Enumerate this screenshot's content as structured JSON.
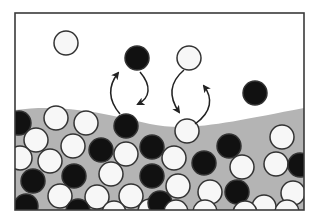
{
  "diagram": {
    "type": "surface-adsorption-desorption",
    "frame": {
      "x": 15,
      "y": 13,
      "width": 289,
      "height": 197,
      "stroke": "#3a3a3a"
    },
    "colors": {
      "background": "#ffffff",
      "substrate": "#b4b4b4",
      "black_particle": "#111111",
      "white_particle": "#f7f7f7",
      "outline": "#333333"
    },
    "gas_particles": [
      {
        "x": 66,
        "y": 43,
        "r": 12,
        "fill": "white"
      },
      {
        "x": 137,
        "y": 58,
        "r": 12,
        "fill": "black"
      },
      {
        "x": 189,
        "y": 58,
        "r": 12,
        "fill": "white"
      },
      {
        "x": 255,
        "y": 93,
        "r": 12,
        "fill": "black"
      }
    ],
    "surface_particles": [
      {
        "x": 126,
        "y": 126,
        "r": 12,
        "fill": "black"
      },
      {
        "x": 187,
        "y": 131,
        "r": 12,
        "fill": "white"
      }
    ],
    "bulk_particles": [
      {
        "x": 19,
        "y": 123,
        "fill": "black"
      },
      {
        "x": 56,
        "y": 118,
        "fill": "white"
      },
      {
        "x": 86,
        "y": 123,
        "fill": "white"
      },
      {
        "x": 36,
        "y": 140,
        "fill": "white"
      },
      {
        "x": 73,
        "y": 146,
        "fill": "white"
      },
      {
        "x": 101,
        "y": 150,
        "fill": "black"
      },
      {
        "x": 126,
        "y": 154,
        "fill": "white"
      },
      {
        "x": 152,
        "y": 147,
        "fill": "black"
      },
      {
        "x": 20,
        "y": 158,
        "fill": "white"
      },
      {
        "x": 50,
        "y": 161,
        "fill": "white"
      },
      {
        "x": 74,
        "y": 176,
        "fill": "black"
      },
      {
        "x": 111,
        "y": 174,
        "fill": "white"
      },
      {
        "x": 152,
        "y": 176,
        "fill": "black"
      },
      {
        "x": 33,
        "y": 181,
        "fill": "black"
      },
      {
        "x": 60,
        "y": 196,
        "fill": "white"
      },
      {
        "x": 97,
        "y": 197,
        "fill": "white"
      },
      {
        "x": 131,
        "y": 196,
        "fill": "white"
      },
      {
        "x": 26,
        "y": 206,
        "fill": "black"
      },
      {
        "x": 78,
        "y": 211,
        "fill": "black"
      },
      {
        "x": 114,
        "y": 213,
        "fill": "white"
      },
      {
        "x": 150,
        "y": 211,
        "fill": "white"
      },
      {
        "x": 174,
        "y": 158,
        "fill": "white"
      },
      {
        "x": 204,
        "y": 163,
        "fill": "black"
      },
      {
        "x": 229,
        "y": 146,
        "fill": "black"
      },
      {
        "x": 242,
        "y": 167,
        "fill": "white"
      },
      {
        "x": 178,
        "y": 186,
        "fill": "white"
      },
      {
        "x": 210,
        "y": 192,
        "fill": "white"
      },
      {
        "x": 237,
        "y": 192,
        "fill": "black"
      },
      {
        "x": 264,
        "y": 207,
        "fill": "white"
      },
      {
        "x": 282,
        "y": 137,
        "fill": "white"
      },
      {
        "x": 276,
        "y": 164,
        "fill": "white"
      },
      {
        "x": 300,
        "y": 165,
        "fill": "black"
      },
      {
        "x": 293,
        "y": 193,
        "fill": "white"
      },
      {
        "x": 160,
        "y": 203,
        "fill": "black"
      },
      {
        "x": 176,
        "y": 212,
        "fill": "white"
      },
      {
        "x": 245,
        "y": 213,
        "fill": "white"
      },
      {
        "x": 287,
        "y": 212,
        "fill": "white"
      },
      {
        "x": 205,
        "y": 212,
        "fill": "white"
      }
    ],
    "arrows": [
      {
        "name": "adsorb-arrow-black",
        "path": "M140 72 C152 86 150 98 138 104",
        "direction": "down"
      },
      {
        "name": "desorb-arrow-black",
        "path": "M120 114 C108 100 108 86 118 73",
        "direction": "up"
      },
      {
        "name": "adsorb-arrow-white",
        "path": "M184 70 C170 82 168 96 179 112",
        "direction": "down"
      },
      {
        "name": "desorb-arrow-white",
        "path": "M195 124 C212 112 213 98 204 86",
        "direction": "up"
      }
    ]
  }
}
